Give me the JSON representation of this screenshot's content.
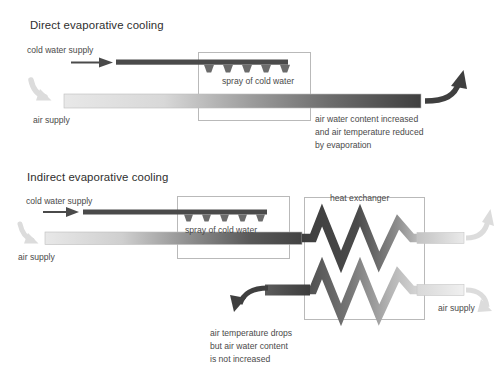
{
  "figure": {
    "background": "#ffffff",
    "ink": "#3f3f3f"
  },
  "palette": {
    "dark_pipe": "#4a4a4a",
    "darker_pipe": "#3d3d3d",
    "light_duct_start": "#e6e6e6",
    "light_duct_end": "#5a5a5a",
    "box_border": "#b9b9b9",
    "light_arrow": "#dcdcdc",
    "dark_arrow": "#3f3f3f",
    "nozzle": "#6b6b6b"
  },
  "panels": [
    {
      "id": "direct",
      "title": "Direct evaporative cooling",
      "labels": {
        "cold_water_supply": "cold water supply",
        "air_supply_in": "air supply",
        "spray_box": "spray of cold water"
      },
      "caption": {
        "lines": [
          "air water content increased",
          "and air temperature reduced",
          "by evaporation"
        ]
      },
      "nozzle_count": 5
    },
    {
      "id": "indirect",
      "title": "Indirect evaporative cooling",
      "labels": {
        "cold_water_supply": "cold water supply",
        "air_supply_in": "air supply",
        "air_supply_out": "air supply",
        "spray_box": "spray of cold water",
        "heat_exchanger": "heat exchanger"
      },
      "caption": {
        "lines": [
          "air temperature drops",
          "but air water content",
          "is not increased"
        ]
      },
      "nozzle_count": 5
    }
  ]
}
